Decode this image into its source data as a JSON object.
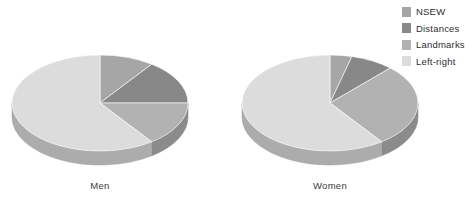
{
  "background_color": "#ffffff",
  "legend": {
    "position": "top-right",
    "items": [
      {
        "label": "NSEW",
        "color": "#a6a6a6",
        "swatch_name": "legend-swatch-nsew"
      },
      {
        "label": "Distances",
        "color": "#888888",
        "swatch_name": "legend-swatch-distances"
      },
      {
        "label": "Landmarks",
        "color": "#b2b2b2",
        "swatch_name": "legend-swatch-landmarks"
      },
      {
        "label": "Left-right",
        "color": "#dcdcdc",
        "swatch_name": "legend-swatch-left-right"
      }
    ]
  },
  "charts": [
    {
      "label": "Men",
      "cx": 100,
      "cy": 103
    },
    {
      "label": "Women",
      "cx": 330,
      "cy": 103
    }
  ],
  "chart_data": {
    "type": "pie",
    "title": "",
    "subtitle": "",
    "xlabel": "",
    "ylabel": "",
    "grid": false,
    "legend_position": "top-right",
    "style": "3d-elliptical-pie",
    "categories": [
      "NSEW",
      "Distances",
      "Landmarks",
      "Left-right"
    ],
    "colors": [
      "#a6a6a6",
      "#888888",
      "#b2b2b2",
      "#dcdcdc"
    ],
    "units": "percent",
    "panels": [
      {
        "name": "Men",
        "label": "Men",
        "center": {
          "x": 100,
          "y": 103
        },
        "radius": {
          "rx": 88,
          "ry": 48
        },
        "depth": 14,
        "start_angle_deg": 0,
        "direction": "clockwise",
        "values": [
          10,
          15,
          15,
          60
        ],
        "slices": [
          {
            "category": "NSEW",
            "value": 10,
            "start_deg": 0,
            "end_deg": 36,
            "color": "#a6a6a6"
          },
          {
            "category": "Distances",
            "value": 15,
            "start_deg": 36,
            "end_deg": 90,
            "color": "#888888"
          },
          {
            "category": "Landmarks",
            "value": 15,
            "start_deg": 90,
            "end_deg": 144,
            "color": "#b2b2b2"
          },
          {
            "category": "Left-right",
            "value": 60,
            "start_deg": 144,
            "end_deg": 360,
            "color": "#dcdcdc"
          }
        ]
      },
      {
        "name": "Women",
        "label": "Women",
        "center": {
          "x": 330,
          "y": 103
        },
        "radius": {
          "rx": 88,
          "ry": 48
        },
        "depth": 14,
        "start_angle_deg": 0,
        "direction": "clockwise",
        "values": [
          4,
          8,
          28,
          60
        ],
        "slices": [
          {
            "category": "NSEW",
            "value": 4,
            "start_deg": 0,
            "end_deg": 14.4,
            "color": "#a6a6a6"
          },
          {
            "category": "Distances",
            "value": 8,
            "start_deg": 14.4,
            "end_deg": 43.2,
            "color": "#888888"
          },
          {
            "category": "Landmarks",
            "value": 28,
            "start_deg": 43.2,
            "end_deg": 144,
            "color": "#b2b2b2"
          },
          {
            "category": "Left-right",
            "value": 60,
            "start_deg": 144,
            "end_deg": 360,
            "color": "#dcdcdc"
          }
        ]
      }
    ]
  }
}
